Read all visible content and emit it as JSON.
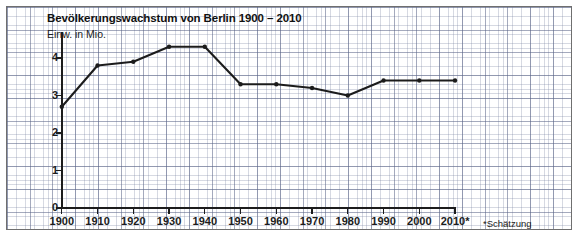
{
  "figure": {
    "title": "Bevölkerungswachstum von Berlin 1900 – 2010",
    "subtitle": "Einw. in Mio.",
    "footnote": "*Schätzung",
    "line_color": "#1c1c1c",
    "grid_color": "#7882a0",
    "frame_color": "#6f6f6f",
    "background": "#ffffff"
  },
  "chart_data": {
    "type": "line",
    "title": "Bevölkerungswachstum von Berlin 1900 – 2010",
    "subtitle": "Einw. in Mio.",
    "xlabel": "",
    "ylabel": "Einw. in Mio.",
    "categories": [
      "1900",
      "1910",
      "1920",
      "1930",
      "1940",
      "1950",
      "1960",
      "1970",
      "1980",
      "1990",
      "2000",
      "2010*"
    ],
    "x": [
      1900,
      1910,
      1920,
      1930,
      1940,
      1950,
      1960,
      1970,
      1980,
      1990,
      2000,
      2010
    ],
    "values": [
      2.7,
      3.8,
      3.9,
      4.3,
      4.3,
      3.3,
      3.3,
      3.2,
      3.0,
      3.4,
      3.4,
      3.4
    ],
    "series": [
      {
        "name": "Einwohner Berlin (Mio.)",
        "values": [
          2.7,
          3.8,
          3.9,
          4.3,
          4.3,
          3.3,
          3.3,
          3.2,
          3.0,
          3.4,
          3.4,
          3.4
        ]
      }
    ],
    "ylim": [
      0,
      4.7
    ],
    "yticks": [
      0,
      1,
      2,
      3,
      4
    ],
    "ytick_labels": [
      "0",
      "1",
      "2",
      "3",
      "4"
    ],
    "xtick_labels": [
      "1900",
      "1910",
      "1920",
      "1930",
      "1940",
      "1950",
      "1960",
      "1970",
      "1980",
      "1990",
      "2000",
      "2010*"
    ],
    "grid": true,
    "legend": "none",
    "markers": true,
    "annotations": [
      "*Schätzung"
    ]
  }
}
